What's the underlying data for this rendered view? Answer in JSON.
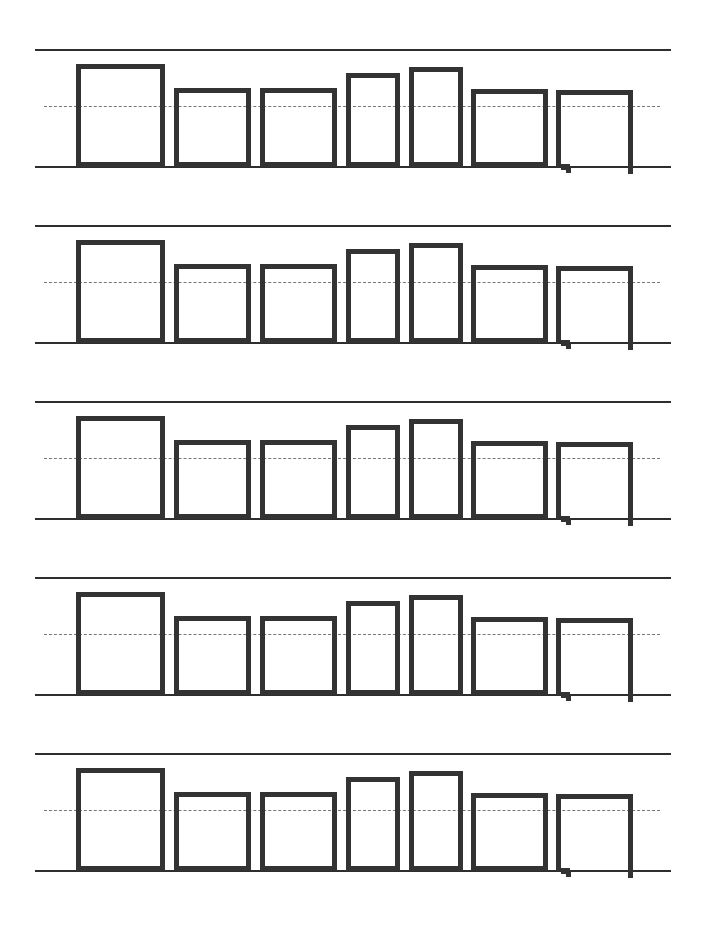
{
  "worksheet": {
    "type": "word-shape handwriting practice",
    "row_count": 5,
    "row_pitch": 176,
    "first_row_top": 49,
    "guide_lines": {
      "top_offset": 0,
      "midline_offset": 57,
      "baseline_offset": 117,
      "line_color": "#2e2e2e",
      "midline_color": "#777777"
    },
    "letter_boxes": [
      {
        "left": 76,
        "width": 89,
        "top_offset": 15,
        "kind": "tall"
      },
      {
        "left": 174,
        "width": 77,
        "top_offset": 39,
        "kind": "short"
      },
      {
        "left": 260,
        "width": 77,
        "top_offset": 39,
        "kind": "short"
      },
      {
        "left": 346,
        "width": 54,
        "top_offset": 24,
        "kind": "tall-narrow"
      },
      {
        "left": 409,
        "width": 54,
        "top_offset": 18,
        "kind": "tall-narrow"
      },
      {
        "left": 471,
        "width": 77,
        "top_offset": 40,
        "kind": "short"
      },
      {
        "left": 556,
        "width": 77,
        "top_offset": 41,
        "kind": "descender-open"
      }
    ],
    "box_color": "#333333"
  }
}
